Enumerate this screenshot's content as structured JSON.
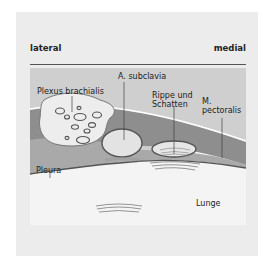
{
  "figure": {
    "orientation": {
      "left_label": "lateral",
      "right_label": "medial"
    },
    "labels": {
      "plexus": "Plexus brachialis",
      "artery": "A. subclavia",
      "rib_line1": "Rippe und",
      "rib_line2": "Schatten",
      "muscle_line1": "M.",
      "muscle_line2": "pectoralis",
      "pleura": "Pleura",
      "lung": "Lunge"
    },
    "colors": {
      "panel_bg": "#ececec",
      "tissue_light": "#c9c9c9",
      "tissue_mid": "#a9a9a9",
      "muscle_dark": "#8f8f8f",
      "lung": "#f4f4f4",
      "outline": "#555555"
    }
  }
}
